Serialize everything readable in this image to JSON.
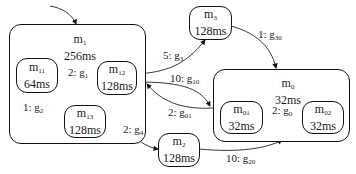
{
  "nodes": {
    "m1": {
      "name": "m",
      "sub": "1",
      "time": "256ms"
    },
    "m11": {
      "name": "m",
      "sub": "11",
      "time": "64ms"
    },
    "m12": {
      "name": "m",
      "sub": "12",
      "time": "128ms"
    },
    "m13": {
      "name": "m",
      "sub": "13",
      "time": "128ms"
    },
    "m2": {
      "name": "m",
      "sub": "2",
      "time": "128ms"
    },
    "m3": {
      "name": "m",
      "sub": "3",
      "time": "128ms"
    },
    "m0": {
      "name": "m",
      "sub": "0",
      "time": "32ms"
    },
    "m01": {
      "name": "m",
      "sub": "01",
      "time": "32ms"
    },
    "m02": {
      "name": "m",
      "sub": "02",
      "time": "32ms"
    }
  },
  "edges": {
    "g1": {
      "count": "2: g",
      "sub": "1"
    },
    "g2": {
      "count": "1: g",
      "sub": "2"
    },
    "g3": {
      "count": "5: g",
      "sub": "3"
    },
    "g4": {
      "count": "2: g",
      "sub": "4"
    },
    "g10": {
      "count": "10: g",
      "sub": "10"
    },
    "g01": {
      "count": "2: g",
      "sub": "01"
    },
    "g30": {
      "count": "1: g",
      "sub": "30"
    },
    "g20": {
      "count": "10: g",
      "sub": "20"
    },
    "g0": {
      "count": "2: g",
      "sub": "0"
    }
  },
  "colors": {
    "stroke": "#111111",
    "background": "#ffffff"
  }
}
